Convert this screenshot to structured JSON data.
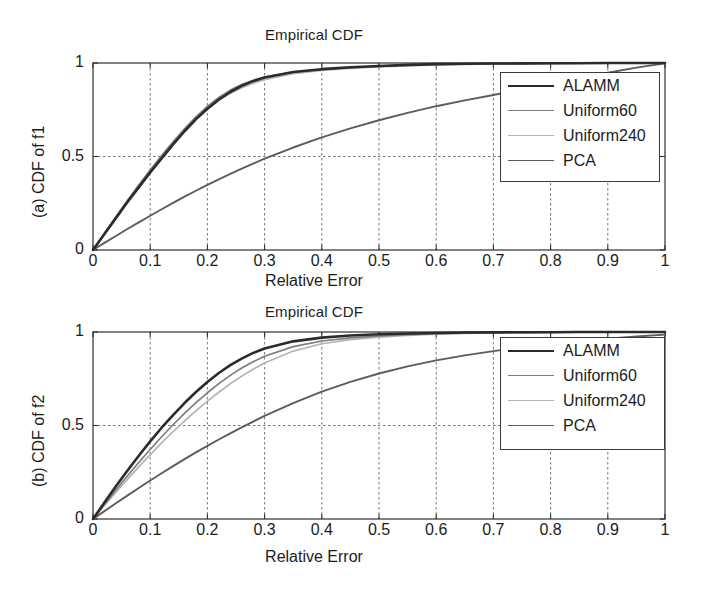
{
  "figure": {
    "background": "#ffffff",
    "panels": [
      "a",
      "b"
    ]
  },
  "panel_a": {
    "title": "Empirical CDF",
    "xlabel": "Relative Error",
    "ylabel": "(a) CDF of f1",
    "xticks": [
      "0",
      "0.1",
      "0.2",
      "0.3",
      "0.4",
      "0.5",
      "0.6",
      "0.7",
      "0.8",
      "0.9",
      "1"
    ],
    "yticks": [
      "0",
      "0.5",
      "1"
    ],
    "legend": [
      {
        "label": "ALAMM",
        "color": "#2b2b2b",
        "width": 2.6
      },
      {
        "label": "Uniform60",
        "color": "#7d7d7d",
        "width": 1.7
      },
      {
        "label": "Uniform240",
        "color": "#b4b4b4",
        "width": 1.7
      },
      {
        "label": "PCA",
        "color": "#5c5c5c",
        "width": 1.9
      }
    ]
  },
  "panel_b": {
    "title": "Empirical CDF",
    "xlabel": "Relative Error",
    "ylabel": "(b) CDF of f2",
    "xticks": [
      "0",
      "0.1",
      "0.2",
      "0.3",
      "0.4",
      "0.5",
      "0.6",
      "0.7",
      "0.8",
      "0.9",
      "1"
    ],
    "yticks": [
      "0",
      "0.5",
      "1"
    ],
    "legend": [
      {
        "label": "ALAMM",
        "color": "#2b2b2b",
        "width": 2.6
      },
      {
        "label": "Uniform60",
        "color": "#7d7d7d",
        "width": 1.7
      },
      {
        "label": "Uniform240",
        "color": "#b4b4b4",
        "width": 1.7
      },
      {
        "label": "PCA",
        "color": "#5c5c5c",
        "width": 1.9
      }
    ]
  },
  "chart_data": [
    {
      "type": "line",
      "panel": "a",
      "title": "Empirical CDF",
      "xlabel": "Relative Error",
      "ylabel": "(a) CDF of f1",
      "xlim": [
        0,
        1
      ],
      "ylim": [
        0,
        1
      ],
      "grid": true,
      "grid_style": "dashed",
      "legend_position": "right",
      "x": [
        0,
        0.02,
        0.04,
        0.06,
        0.08,
        0.1,
        0.12,
        0.14,
        0.16,
        0.18,
        0.2,
        0.22,
        0.24,
        0.26,
        0.28,
        0.3,
        0.35,
        0.4,
        0.45,
        0.5,
        0.55,
        0.6,
        0.65,
        0.7,
        0.75,
        0.8,
        0.85,
        0.9,
        0.95,
        1.0
      ],
      "series": [
        {
          "name": "ALAMM",
          "color": "#2b2b2b",
          "values": [
            0.0,
            0.085,
            0.17,
            0.255,
            0.335,
            0.415,
            0.49,
            0.565,
            0.635,
            0.7,
            0.755,
            0.805,
            0.845,
            0.878,
            0.903,
            0.922,
            0.952,
            0.967,
            0.977,
            0.984,
            0.99,
            0.994,
            0.996,
            0.997,
            0.998,
            0.999,
            0.999,
            1.0,
            1.0,
            1.0
          ]
        },
        {
          "name": "Uniform60",
          "color": "#7d7d7d",
          "values": [
            0.0,
            0.09,
            0.178,
            0.265,
            0.348,
            0.428,
            0.505,
            0.578,
            0.648,
            0.712,
            0.768,
            0.816,
            0.855,
            0.885,
            0.908,
            0.925,
            0.952,
            0.966,
            0.975,
            0.982,
            0.988,
            0.992,
            0.995,
            0.996,
            0.997,
            0.998,
            0.999,
            0.999,
            1.0,
            1.0
          ]
        },
        {
          "name": "Uniform240",
          "color": "#b4b4b4",
          "values": [
            0.0,
            0.088,
            0.175,
            0.26,
            0.342,
            0.42,
            0.495,
            0.568,
            0.636,
            0.698,
            0.752,
            0.799,
            0.838,
            0.868,
            0.892,
            0.911,
            0.943,
            0.96,
            0.971,
            0.979,
            0.985,
            0.99,
            0.993,
            0.995,
            0.997,
            0.998,
            0.999,
            0.999,
            1.0,
            1.0
          ]
        },
        {
          "name": "PCA",
          "color": "#5c5c5c",
          "values": [
            0.0,
            0.038,
            0.075,
            0.112,
            0.148,
            0.183,
            0.218,
            0.252,
            0.285,
            0.317,
            0.348,
            0.378,
            0.407,
            0.435,
            0.462,
            0.488,
            0.548,
            0.602,
            0.65,
            0.694,
            0.733,
            0.769,
            0.8,
            0.829,
            0.858,
            0.888,
            0.918,
            0.948,
            0.975,
            0.998
          ]
        }
      ]
    },
    {
      "type": "line",
      "panel": "b",
      "title": "Empirical CDF",
      "xlabel": "Relative Error",
      "ylabel": "(b) CDF of f2",
      "xlim": [
        0,
        1
      ],
      "ylim": [
        0,
        1
      ],
      "grid": true,
      "grid_style": "dashed",
      "legend_position": "right",
      "x": [
        0,
        0.02,
        0.04,
        0.06,
        0.08,
        0.1,
        0.12,
        0.14,
        0.16,
        0.18,
        0.2,
        0.22,
        0.24,
        0.26,
        0.28,
        0.3,
        0.35,
        0.4,
        0.45,
        0.5,
        0.55,
        0.6,
        0.65,
        0.7,
        0.75,
        0.8,
        0.85,
        0.9,
        0.95,
        1.0
      ],
      "series": [
        {
          "name": "ALAMM",
          "color": "#2b2b2b",
          "values": [
            0.0,
            0.088,
            0.175,
            0.258,
            0.338,
            0.415,
            0.488,
            0.556,
            0.62,
            0.679,
            0.733,
            0.781,
            0.823,
            0.858,
            0.888,
            0.912,
            0.95,
            0.97,
            0.981,
            0.988,
            0.992,
            0.995,
            0.997,
            0.998,
            0.999,
            0.999,
            1.0,
            1.0,
            1.0,
            1.0
          ]
        },
        {
          "name": "Uniform60",
          "color": "#7d7d7d",
          "values": [
            0.0,
            0.078,
            0.155,
            0.23,
            0.302,
            0.372,
            0.44,
            0.504,
            0.565,
            0.622,
            0.675,
            0.724,
            0.768,
            0.807,
            0.841,
            0.87,
            0.922,
            0.952,
            0.969,
            0.979,
            0.986,
            0.991,
            0.994,
            0.996,
            0.998,
            0.999,
            0.999,
            1.0,
            1.0,
            1.0
          ]
        },
        {
          "name": "Uniform240",
          "color": "#b4b4b4",
          "values": [
            0.0,
            0.072,
            0.143,
            0.212,
            0.279,
            0.344,
            0.407,
            0.467,
            0.524,
            0.578,
            0.63,
            0.678,
            0.723,
            0.764,
            0.801,
            0.834,
            0.898,
            0.937,
            0.959,
            0.973,
            0.982,
            0.988,
            0.992,
            0.995,
            0.997,
            0.998,
            0.999,
            1.0,
            1.0,
            1.0
          ]
        },
        {
          "name": "PCA",
          "color": "#5c5c5c",
          "values": [
            0.0,
            0.042,
            0.084,
            0.125,
            0.166,
            0.206,
            0.245,
            0.283,
            0.32,
            0.356,
            0.391,
            0.425,
            0.458,
            0.49,
            0.521,
            0.551,
            0.62,
            0.681,
            0.733,
            0.778,
            0.816,
            0.848,
            0.875,
            0.898,
            0.918,
            0.936,
            0.951,
            0.964,
            0.976,
            0.986
          ]
        }
      ]
    }
  ]
}
